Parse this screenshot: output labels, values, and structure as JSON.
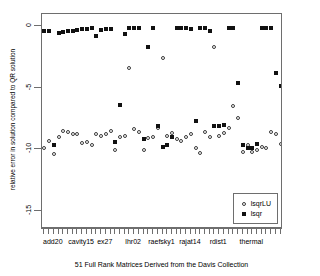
{
  "chart_data": {
    "type": "scatter",
    "title": "",
    "xlabel": "51 Full Rank Matrices Derived from the Davis Collection",
    "ylabel": "relative error in solution compared to QR solution",
    "ylim": [
      -16.5,
      1.0
    ],
    "xlim": [
      0.5,
      51.5
    ],
    "yticks": [
      0,
      -5,
      -10,
      -15
    ],
    "ytick_labels": [
      "0",
      "-5",
      "-10",
      "-15"
    ],
    "grid": false,
    "legend_position": "bottom-right",
    "xtick_count": 51,
    "xtick_labels": [
      "add20",
      "cavity15",
      "ex27",
      "lhr02",
      "raefsky1",
      "rajat14",
      "rdist1",
      "thermal"
    ],
    "xtick_label_positions": [
      3,
      9,
      14,
      20,
      26,
      32,
      38,
      45
    ],
    "legend": [
      {
        "name": "lsqrLU",
        "marker": "open-circle",
        "color": "#3a3a3a"
      },
      {
        "name": "lsqr",
        "marker": "filled-square",
        "color": "#111111"
      }
    ],
    "series": [
      {
        "name": "lsqrLU",
        "marker": "open-circle",
        "points": [
          [
            1,
            -9.9
          ],
          [
            2,
            -9.3
          ],
          [
            3,
            -10.4
          ],
          [
            4,
            -9.0
          ],
          [
            5,
            -8.5
          ],
          [
            6,
            -8.6
          ],
          [
            7,
            -8.8
          ],
          [
            8,
            -8.8
          ],
          [
            9,
            -9.5
          ],
          [
            10,
            -9.4
          ],
          [
            11,
            -9.7
          ],
          [
            12,
            -8.8
          ],
          [
            13,
            -8.9
          ],
          [
            14,
            -8.8
          ],
          [
            15,
            -8.5
          ],
          [
            16,
            -10.1
          ],
          [
            17,
            -9.0
          ],
          [
            18,
            -8.9
          ],
          [
            19,
            -3.4
          ],
          [
            20,
            -8.4
          ],
          [
            21,
            -8.6
          ],
          [
            22,
            -10.1
          ],
          [
            23,
            -9.1
          ],
          [
            24,
            -9.0
          ],
          [
            25,
            -8.3
          ],
          [
            26,
            -2.6
          ],
          [
            27,
            -8.9
          ],
          [
            28,
            -8.7
          ],
          [
            29,
            -9.2
          ],
          [
            30,
            -9.3
          ],
          [
            31,
            -9.0
          ],
          [
            32,
            -8.8
          ],
          [
            33,
            -9.9
          ],
          [
            34,
            -10.3
          ],
          [
            35,
            -8.6
          ],
          [
            36,
            -9.0
          ],
          [
            37,
            -1.7
          ],
          [
            38,
            -8.9
          ],
          [
            39,
            -8.7
          ],
          [
            40,
            -8.3
          ],
          [
            41,
            -6.5
          ],
          [
            42,
            -7.5
          ],
          [
            43,
            -10.2
          ],
          [
            44,
            -9.7
          ],
          [
            45,
            -10.2
          ],
          [
            46,
            -10.1
          ],
          [
            47,
            -9.8
          ],
          [
            48,
            -9.9
          ],
          [
            49,
            -8.6
          ],
          [
            50,
            -8.8
          ],
          [
            51,
            -9.6
          ]
        ]
      },
      {
        "name": "lsqr",
        "marker": "filled-square",
        "points": [
          [
            1,
            -0.35
          ],
          [
            2,
            -0.35
          ],
          [
            3,
            -9.7
          ],
          [
            4,
            -0.55
          ],
          [
            5,
            -0.45
          ],
          [
            6,
            -0.4
          ],
          [
            7,
            -0.35
          ],
          [
            8,
            -0.3
          ],
          [
            9,
            -0.25
          ],
          [
            10,
            -0.2
          ],
          [
            11,
            -0.1
          ],
          [
            12,
            -0.75
          ],
          [
            13,
            -0.3
          ],
          [
            14,
            -0.25
          ],
          [
            15,
            -0.2
          ],
          [
            16,
            -9.4
          ],
          [
            17,
            -6.4
          ],
          [
            18,
            -0.6
          ],
          [
            19,
            -0.15
          ],
          [
            20,
            -0.1
          ],
          [
            21,
            -0.1
          ],
          [
            22,
            -9.2
          ],
          [
            23,
            -1.7
          ],
          [
            24,
            -0.1
          ],
          [
            25,
            -8.1
          ],
          [
            26,
            -9.8
          ],
          [
            27,
            -9.7
          ],
          [
            28,
            -9.0
          ],
          [
            29,
            -0.1
          ],
          [
            30,
            -0.1
          ],
          [
            31,
            -0.1
          ],
          [
            32,
            -0.2
          ],
          [
            33,
            -7.7
          ],
          [
            34,
            -0.1
          ],
          [
            35,
            -0.1
          ],
          [
            36,
            -0.35
          ],
          [
            37,
            -8.1
          ],
          [
            38,
            -8.1
          ],
          [
            39,
            -8.0
          ],
          [
            40,
            -0.1
          ],
          [
            41,
            -0.1
          ],
          [
            42,
            -4.6
          ],
          [
            43,
            -9.7
          ],
          [
            44,
            -9.9
          ],
          [
            45,
            -9.9
          ],
          [
            46,
            -9.6
          ],
          [
            47,
            -0.1
          ],
          [
            48,
            -0.1
          ],
          [
            49,
            -0.15
          ],
          [
            50,
            -3.8
          ],
          [
            51,
            -4.9
          ]
        ]
      }
    ]
  },
  "axis": {
    "y_title": "relative error in solution compared to QR solution",
    "x_caption": "51 Full Rank Matrices Derived from the Davis Collection"
  },
  "legend": {
    "items": [
      {
        "label": "lsqrLU"
      },
      {
        "label": "lsqr"
      }
    ]
  }
}
